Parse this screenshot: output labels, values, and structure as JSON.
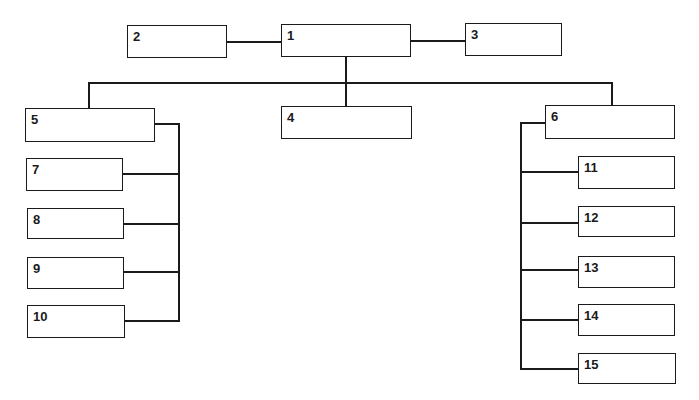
{
  "diagram": {
    "type": "organization-chart",
    "line_color": "#1a1a1a",
    "boxes": [
      {
        "id": "1",
        "label": "1",
        "text": ""
      },
      {
        "id": "2",
        "label": "2",
        "text": ""
      },
      {
        "id": "3",
        "label": "3",
        "text": ""
      },
      {
        "id": "4",
        "label": "4",
        "text": ""
      },
      {
        "id": "5",
        "label": "5",
        "text": ""
      },
      {
        "id": "6",
        "label": "6",
        "text": ""
      },
      {
        "id": "7",
        "label": "7",
        "text": ""
      },
      {
        "id": "8",
        "label": "8",
        "text": ""
      },
      {
        "id": "9",
        "label": "9",
        "text": ""
      },
      {
        "id": "10",
        "label": "10",
        "text": ""
      },
      {
        "id": "11",
        "label": "11",
        "text": ""
      },
      {
        "id": "12",
        "label": "12",
        "text": ""
      },
      {
        "id": "13",
        "label": "13",
        "text": ""
      },
      {
        "id": "14",
        "label": "14",
        "text": ""
      },
      {
        "id": "15",
        "label": "15",
        "text": ""
      }
    ],
    "connections": [
      {
        "from": "1",
        "to": "2",
        "kind": "side"
      },
      {
        "from": "1",
        "to": "3",
        "kind": "side"
      },
      {
        "from": "1",
        "to": "4",
        "kind": "child"
      },
      {
        "from": "1",
        "to": "5",
        "kind": "child"
      },
      {
        "from": "1",
        "to": "6",
        "kind": "child"
      },
      {
        "from": "5",
        "to": "7",
        "kind": "child"
      },
      {
        "from": "5",
        "to": "8",
        "kind": "child"
      },
      {
        "from": "5",
        "to": "9",
        "kind": "child"
      },
      {
        "from": "5",
        "to": "10",
        "kind": "child"
      },
      {
        "from": "6",
        "to": "11",
        "kind": "child"
      },
      {
        "from": "6",
        "to": "12",
        "kind": "child"
      },
      {
        "from": "6",
        "to": "13",
        "kind": "child"
      },
      {
        "from": "6",
        "to": "14",
        "kind": "child"
      },
      {
        "from": "6",
        "to": "15",
        "kind": "child"
      }
    ]
  }
}
